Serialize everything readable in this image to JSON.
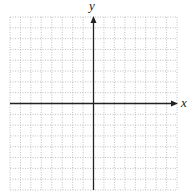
{
  "chart_data": {
    "type": "grid",
    "title": "",
    "xlabel": "x",
    "ylabel": "y",
    "grid": true,
    "grid_style": "dotted",
    "columns": 16,
    "rows": 16,
    "origin_col": 8,
    "origin_row": 8,
    "series": [],
    "tick_labels": false,
    "colors": {
      "grid": "#b0b0b0",
      "axis": "#222222",
      "background": "#ffffff"
    }
  }
}
